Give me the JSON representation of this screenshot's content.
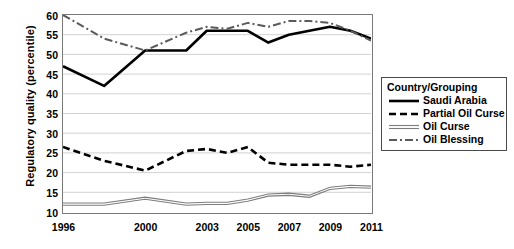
{
  "chart_data": {
    "type": "line",
    "title": "",
    "xlabel": "",
    "ylabel": "Regulatory quality (percentile)",
    "ylim": [
      10,
      60
    ],
    "ytick_step": 5,
    "yticks": [
      60,
      55,
      50,
      45,
      40,
      35,
      30,
      25,
      20,
      15,
      10
    ],
    "xticks": [
      1996,
      2000,
      2003,
      2005,
      2007,
      2009,
      2011
    ],
    "x": [
      1996,
      1998,
      2000,
      2002,
      2003,
      2004,
      2005,
      2006,
      2007,
      2008,
      2009,
      2010,
      2011
    ],
    "grid": "horizontal",
    "legend_position": "right",
    "legend_title": "Country/Grouping",
    "series": [
      {
        "name": "Saudi Arabia",
        "style": "solid",
        "color": "#000000",
        "values": [
          47,
          42,
          51,
          51,
          56,
          56,
          56,
          53,
          55,
          56,
          57,
          56,
          54
        ]
      },
      {
        "name": "Partial Oil Curse",
        "style": "dashed",
        "color": "#000000",
        "values": [
          26.5,
          23,
          20.5,
          25.5,
          26,
          25,
          26.5,
          22.5,
          22,
          22,
          22,
          21.5,
          22
        ]
      },
      {
        "name": "Oil Curse",
        "style": "double-thin",
        "color": "#7d7d7d",
        "values": [
          12,
          12,
          13.5,
          12,
          12.2,
          12.2,
          13,
          14.3,
          14.5,
          14,
          16,
          16.5,
          16.3
        ]
      },
      {
        "name": "Oil Blessing",
        "style": "dash-dot",
        "color": "#5a5a5a",
        "values": [
          60,
          54,
          51,
          55.5,
          57,
          56.5,
          58,
          57,
          58.5,
          58.5,
          58,
          56,
          53.5
        ]
      }
    ]
  },
  "legend": {
    "title": "Country/Grouping",
    "items": [
      {
        "label": "Saudi Arabia",
        "swatch": "solid-line-icon"
      },
      {
        "label": "Partial Oil Curse",
        "swatch": "dashed-line-icon"
      },
      {
        "label": "Oil Curse",
        "swatch": "double-thin-line-icon"
      },
      {
        "label": "Oil Blessing",
        "swatch": "dash-dot-line-icon"
      }
    ]
  },
  "axes": {
    "y_title": "Regulatory quality (percentile)",
    "y_labels": [
      "60",
      "55",
      "50",
      "45",
      "40",
      "35",
      "30",
      "25",
      "20",
      "15",
      "10"
    ],
    "x_labels": [
      "1996",
      "2000",
      "2003",
      "2005",
      "2007",
      "2009",
      "2011"
    ]
  }
}
